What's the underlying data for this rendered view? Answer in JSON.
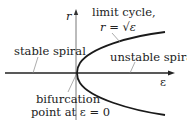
{
  "diagram": {
    "type": "bifurcation-diagram",
    "axes": {
      "vertical_label": "r",
      "horizontal_label": "ε"
    },
    "labels": {
      "limit_cycle": "limit cycle,",
      "limit_cycle_formula": "r = √ε",
      "stable_spiral": "stable spiral",
      "unstable_spiral": "unstable spiral",
      "bifurcation_line1": "bifurcation",
      "bifurcation_line2": "point at ε = 0"
    },
    "colors": {
      "curve": "#1a1a1a",
      "axis": "#333333",
      "leader": "#888888",
      "text": "#222222"
    }
  }
}
